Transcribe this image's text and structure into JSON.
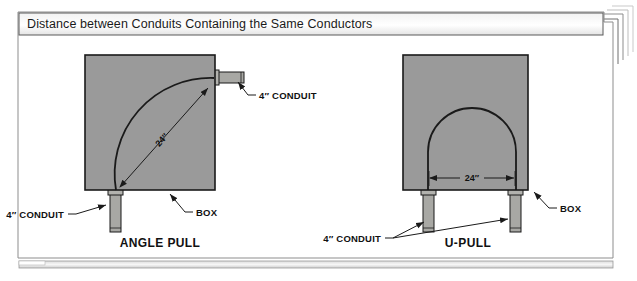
{
  "figure": {
    "title": "Distance between Conduits Containing the Same Conductors",
    "background_color": "#ffffff",
    "frame_color": "#8d8d8d",
    "box_fill_color": "#9a9a9a",
    "box_stroke_color": "#1a1a1a",
    "conduit_fill_color": "#a8a8a4",
    "line_color": "#1a1a1a"
  },
  "diagrams": [
    {
      "id": "angle-pull",
      "caption": "ANGLE PULL",
      "dimension_label": "24″",
      "box_label": "BOX",
      "conduit_label_top": "4″ CONDUIT",
      "conduit_label_bottom": "4″ CONDUIT"
    },
    {
      "id": "u-pull",
      "caption": "U-PULL",
      "dimension_label": "24″",
      "box_label": "BOX",
      "conduit_label": "4″ CONDUIT"
    }
  ]
}
